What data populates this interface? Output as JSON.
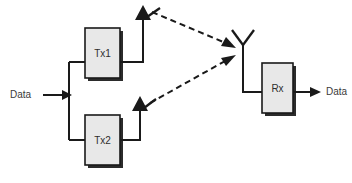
{
  "diagram": {
    "background_color": "#ffffff",
    "line_color": "#1a1a1a",
    "box_fill_color": "#e8e8e8",
    "labels": {
      "input_data": "Data",
      "output_data": "Data",
      "tx1": "Tx1",
      "tx2": "Tx2",
      "rx": "Rx"
    },
    "blocks": [
      {
        "id": "tx1",
        "label": "Tx1",
        "x": 85,
        "y": 28,
        "width": 35,
        "height": 50
      },
      {
        "id": "tx2",
        "label": "Tx2",
        "x": 85,
        "y": 115,
        "width": 35,
        "height": 50
      },
      {
        "id": "rx",
        "label": "Rx",
        "x": 262,
        "y": 63,
        "width": 31,
        "height": 50
      }
    ],
    "antennas": [
      {
        "id": "tx1-antenna",
        "type": "arrow-up",
        "x": 143,
        "tip_y": 6,
        "base_y": 53
      },
      {
        "id": "tx2-antenna",
        "type": "arrow-up",
        "x": 140,
        "tip_y": 96,
        "base_y": 140
      },
      {
        "id": "rx-antenna",
        "type": "dipole-y",
        "x": 243,
        "top_y": 30,
        "fork_y": 45,
        "base_y": 92
      }
    ],
    "wireless_links": [
      {
        "id": "link-tx1-rx",
        "from": "tx1-antenna",
        "to": "rx-antenna",
        "style": "dashed"
      },
      {
        "id": "link-tx2-rx",
        "from": "tx2-antenna",
        "to": "rx-antenna",
        "style": "dashed"
      }
    ]
  }
}
